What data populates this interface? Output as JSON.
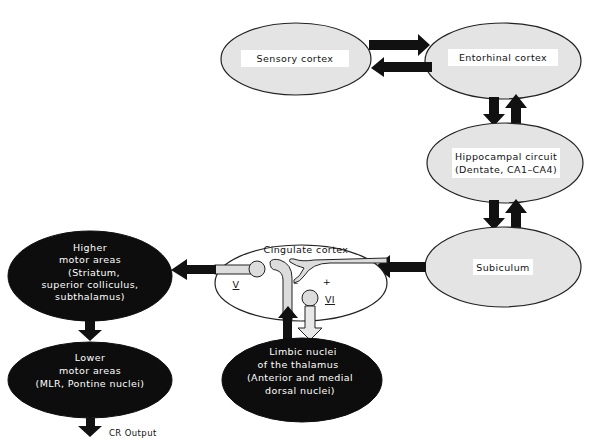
{
  "nodes": {
    "sensory": {
      "label": "Sensory cortex"
    },
    "entorhinal": {
      "label": "Entorhinal cortex"
    },
    "hippocampal": {
      "line1": "Hippocampal circuit",
      "line2": "(Dentate, CA1–CA4)"
    },
    "subiculum": {
      "label": "Subiculum"
    },
    "cingulate": {
      "label": "Cingulate cortex",
      "layer_v": "V",
      "layer_vi": "VI",
      "minus": "–",
      "plus": "+"
    },
    "higher_motor": {
      "line1": "Higher",
      "line2": "motor areas",
      "line3": "(Striatum,",
      "line4": "superior colliculus,",
      "line5": "subthalamus)"
    },
    "lower_motor": {
      "line1": "Lower",
      "line2": "motor areas",
      "line3": "(MLR, Pontine nuclei)"
    },
    "limbic": {
      "line1": "Limbic nuclei",
      "line2": "of the thalamus",
      "line3": "(Anterior and medial",
      "line4": "dorsal nuclei)"
    }
  },
  "output": {
    "label": "CR Output"
  },
  "colors": {
    "light_node": "#e4e4e4",
    "dark_node": "#0d0d0d",
    "arrow": "#111111"
  }
}
